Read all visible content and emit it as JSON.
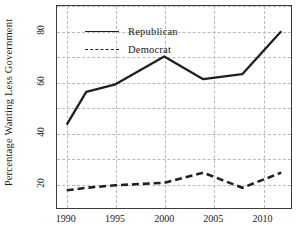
{
  "chart_data": {
    "type": "line",
    "title": "",
    "subtitle": "",
    "xlabel": "",
    "ylabel": "Percentage Wanting Less Government",
    "xlim": [
      1989,
      2013
    ],
    "ylim": [
      10,
      90
    ],
    "xticks": [
      1990,
      1995,
      2000,
      2005,
      2010
    ],
    "xtick_labels": [
      "1990",
      "1995",
      "2000",
      "2005",
      "2010"
    ],
    "yticks": [
      20,
      40,
      60,
      80
    ],
    "ytick_labels": [
      "20",
      "40",
      "60",
      "80"
    ],
    "grid": true,
    "grid_style": "dashed",
    "grid_color": "#b9b9b9",
    "legend_position": "upper-left-inside",
    "series": [
      {
        "name": "Republican",
        "style": "solid",
        "color": "#1f1f1f",
        "x": [
          1990,
          1992,
          1995,
          2000,
          2004,
          2008,
          2012
        ],
        "values": [
          43,
          56,
          59,
          70,
          61,
          63,
          80
        ]
      },
      {
        "name": "Democrat",
        "style": "dashed",
        "color": "#1f1f1f",
        "x": [
          1990,
          1992,
          1995,
          2000,
          2004,
          2008,
          2012
        ],
        "values": [
          17,
          18,
          19,
          20,
          24,
          18,
          24
        ]
      }
    ]
  },
  "legend": {
    "items": [
      {
        "label": "Republican",
        "style": "solid"
      },
      {
        "label": "Democrat",
        "style": "dashed"
      }
    ]
  },
  "axes": {
    "y_title": "Percentage Wanting Less Government"
  }
}
